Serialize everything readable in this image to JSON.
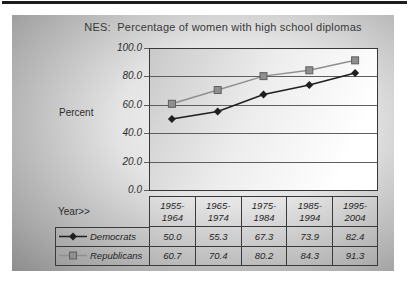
{
  "page": {
    "background": "#ffffff",
    "top_bar_color": "#1c1c1c"
  },
  "chart_data": {
    "type": "line",
    "title": "NES:  Percentage of women with high school diplomas",
    "ylabel": "Percent",
    "xlabel": "Year>>",
    "ylim": [
      0,
      100
    ],
    "yticks": [
      "100.0",
      "80.0",
      "60.0",
      "40.0",
      "20.0",
      "0.0"
    ],
    "grid": "horizontal",
    "grid_color": "#5e5e5e",
    "axis_color": "#383838",
    "legend_position": "table-left",
    "categories": [
      "1955-1964",
      "1965-1974",
      "1975-1984",
      "1985-1994",
      "1995-2004"
    ],
    "category_labels_top": [
      "1955-",
      "1965-",
      "1975-",
      "1985-",
      "1995-"
    ],
    "category_labels_bottom": [
      "1964",
      "1974",
      "1984",
      "1994",
      "2004"
    ],
    "series": [
      {
        "name": "Democrats",
        "marker": "diamond",
        "color": "#1f1f1f",
        "values": [
          50.0,
          55.3,
          67.3,
          73.9,
          82.4
        ],
        "display": [
          "50.0",
          "55.3",
          "67.3",
          "73.9",
          "82.4"
        ]
      },
      {
        "name": "Republicans",
        "marker": "square",
        "color": "#8f8f8f",
        "marker_edge": "#5f5f5f",
        "values": [
          60.7,
          70.4,
          80.2,
          84.3,
          91.3
        ],
        "display": [
          "60.7",
          "70.4",
          "80.2",
          "84.3",
          "91.3"
        ]
      }
    ]
  }
}
